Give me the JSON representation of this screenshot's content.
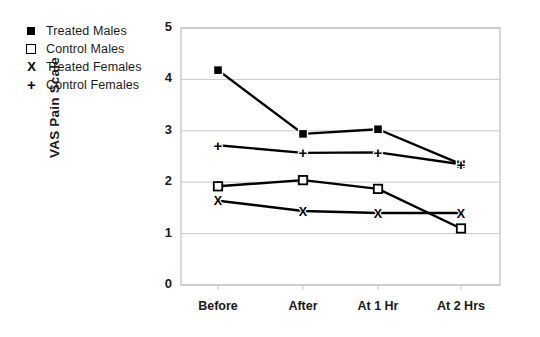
{
  "legend": {
    "items": [
      {
        "label": "Treated Males",
        "marker": "filled-square"
      },
      {
        "label": "Control Males",
        "marker": "open-square"
      },
      {
        "label": "Treated Females",
        "marker": "x"
      },
      {
        "label": "Control Females",
        "marker": "plus"
      }
    ]
  },
  "colors": {
    "line": "#000000",
    "grid": "#c8c8c8",
    "frame": "#bfbfbf",
    "text": "#1a1a1a"
  },
  "chart_data": {
    "type": "line",
    "title": "",
    "xlabel": "",
    "ylabel": "VAS Pain Scale",
    "categories": [
      "Before",
      "After",
      "At 1 Hr",
      "At 2 Hrs"
    ],
    "ylim": [
      0,
      5
    ],
    "yticks": [
      0,
      1,
      2,
      3,
      4,
      5
    ],
    "grid": true,
    "legend_position": "top-left-outside",
    "series": [
      {
        "name": "Treated Males",
        "marker": "filled-square",
        "values": [
          4.18,
          2.94,
          3.03,
          2.35
        ]
      },
      {
        "name": "Control Males",
        "marker": "open-square",
        "values": [
          1.92,
          2.04,
          1.87,
          1.1
        ]
      },
      {
        "name": "Treated Females",
        "marker": "x",
        "values": [
          1.64,
          1.44,
          1.4,
          1.4
        ]
      },
      {
        "name": "Control Females",
        "marker": "plus",
        "values": [
          2.72,
          2.57,
          2.58,
          2.35
        ]
      }
    ]
  }
}
